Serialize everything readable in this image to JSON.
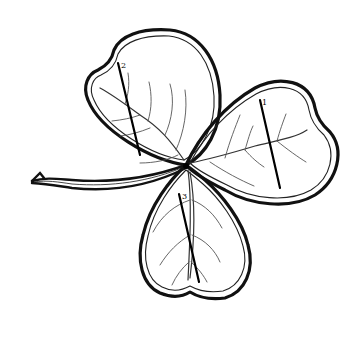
{
  "diagram": {
    "colors": {
      "background": "#ffffff",
      "ink": "#111111"
    },
    "leaves": [
      {
        "id": "leaf-1",
        "position": "right",
        "label": "1"
      },
      {
        "id": "leaf-2",
        "position": "upper-left",
        "label": "2"
      },
      {
        "id": "leaf-3",
        "position": "bottom",
        "label": "3"
      }
    ],
    "stem": {
      "direction": "left"
    }
  }
}
